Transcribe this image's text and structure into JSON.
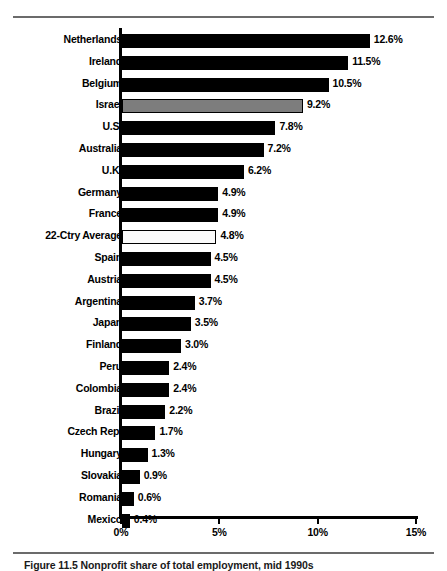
{
  "figure": {
    "caption": "Figure 11.5  Nonprofit share of total employment, mid 1990s",
    "rule_color": "#6b6b6b"
  },
  "chart_data": {
    "type": "bar",
    "orientation": "horizontal",
    "title": "",
    "subtitle": "",
    "xlabel": "",
    "ylabel": "",
    "xlim": [
      0,
      15
    ],
    "xticks": [
      "0%",
      "5%",
      "10%",
      "15%"
    ],
    "xtick_values": [
      0,
      5,
      10,
      15
    ],
    "grid": false,
    "legend": "none",
    "value_suffix": "%",
    "bar_color": "#000000",
    "highlight_color": "#7d7d7d",
    "average_color": "#fbfbfb",
    "categories": [
      "Netherlands",
      "Ireland",
      "Belgium",
      "Israel",
      "U.S.",
      "Australia",
      "U.K.",
      "Germany",
      "France",
      "22-Ctry Average",
      "Spain",
      "Austria",
      "Argentina",
      "Japan",
      "Finland",
      "Peru",
      "Colombia",
      "Brazil",
      "Czech Rep.",
      "Hungary",
      "Slovakia",
      "Romania",
      "Mexico"
    ],
    "values": [
      12.6,
      11.5,
      10.5,
      9.2,
      7.8,
      7.2,
      6.2,
      4.9,
      4.9,
      4.8,
      4.5,
      4.5,
      3.7,
      3.5,
      3.0,
      2.4,
      2.4,
      2.2,
      1.7,
      1.3,
      0.9,
      0.6,
      0.4
    ],
    "value_labels": [
      "12.6%",
      "11.5%",
      "10.5%",
      "9.2%",
      "7.8%",
      "7.2%",
      "6.2%",
      "4.9%",
      "4.9%",
      "4.8%",
      "4.5%",
      "4.5%",
      "3.7%",
      "3.5%",
      "3.0%",
      "2.4%",
      "2.4%",
      "2.2%",
      "1.7%",
      "1.3%",
      "0.9%",
      "0.6%",
      "0.4%"
    ],
    "styles": [
      "solid",
      "solid",
      "solid",
      "highlight",
      "solid",
      "solid",
      "solid",
      "solid",
      "solid",
      "average",
      "solid",
      "solid",
      "solid",
      "solid",
      "solid",
      "solid",
      "solid",
      "solid",
      "solid",
      "solid",
      "solid",
      "solid",
      "solid"
    ]
  }
}
